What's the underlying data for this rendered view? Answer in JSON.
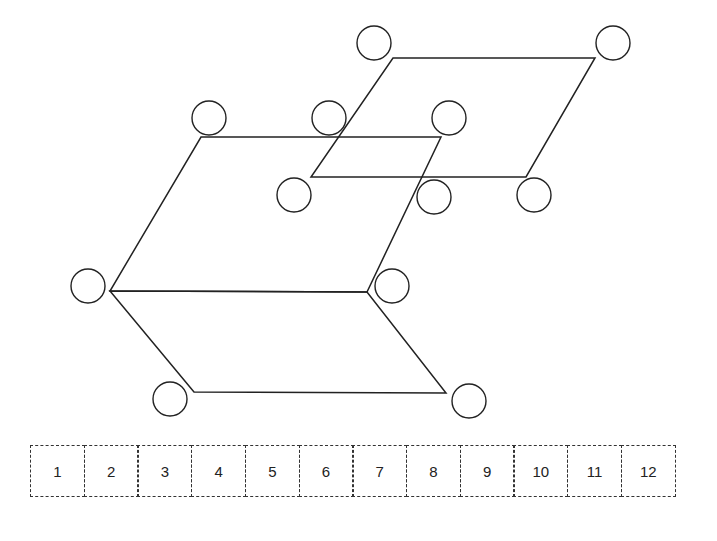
{
  "diagram": {
    "stroke": "#222222",
    "circle_radius": 17,
    "shapes": [
      {
        "name": "upper-parallelogram",
        "points": [
          [
            393,
            58
          ],
          [
            595,
            58
          ],
          [
            526,
            177
          ],
          [
            311,
            177
          ]
        ]
      },
      {
        "name": "top-face-parallelogram",
        "points": [
          [
            201,
            137
          ],
          [
            441,
            137
          ],
          [
            367,
            292
          ],
          [
            110,
            291
          ]
        ]
      },
      {
        "name": "bottom-face-parallelogram",
        "points": [
          [
            110,
            291
          ],
          [
            367,
            292
          ],
          [
            446,
            393
          ],
          [
            194,
            392
          ]
        ]
      }
    ],
    "circles": [
      [
        374,
        43
      ],
      [
        613,
        43
      ],
      [
        209,
        118
      ],
      [
        329,
        118
      ],
      [
        449,
        118
      ],
      [
        294,
        195
      ],
      [
        434,
        197
      ],
      [
        534,
        195
      ],
      [
        88,
        286
      ],
      [
        392,
        286
      ],
      [
        170,
        399
      ],
      [
        469,
        401
      ]
    ]
  },
  "strip": {
    "cells": [
      "1",
      "2",
      "3",
      "4",
      "5",
      "6",
      "7",
      "8",
      "9",
      "10",
      "11",
      "12"
    ]
  }
}
